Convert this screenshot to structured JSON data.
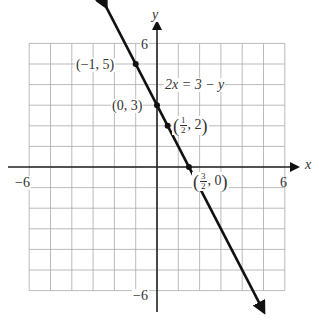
{
  "chart_data": {
    "type": "line",
    "title": "",
    "equation": "2x = 3 − y",
    "xlabel": "x",
    "ylabel": "y",
    "xlim": [
      -6,
      6
    ],
    "ylim": [
      -6,
      6
    ],
    "grid": true,
    "grid_step": 1,
    "x_tick_labels": [
      "−6",
      "6"
    ],
    "y_tick_labels": [
      "6",
      "−6"
    ],
    "series": [
      {
        "name": "2x = 3 − y",
        "slope": -2,
        "intercept": 3,
        "x": [
          -1.5,
          4.5
        ],
        "y": [
          6,
          -6
        ]
      }
    ],
    "points": [
      {
        "x": -1,
        "y": 5,
        "label": "(−1, 5)"
      },
      {
        "x": 0,
        "y": 3,
        "label": "(0, 3)"
      },
      {
        "x": 0.5,
        "y": 2,
        "label": "(1/2, 2)"
      },
      {
        "x": 1.5,
        "y": 0,
        "label": "(3/2, 0)"
      }
    ]
  },
  "labels": {
    "x_axis": "x",
    "y_axis": "y",
    "x_min": "−6",
    "x_max": "6",
    "y_max": "6",
    "y_min": "−6",
    "equation": "2x = 3 − y",
    "p1": "(−1, 5)",
    "p2": "(0, 3)",
    "p3_num": "1",
    "p3_den": "2",
    "p3_rest": ", 2",
    "p4_num": "3",
    "p4_den": "2",
    "p4_rest": ", 0"
  }
}
